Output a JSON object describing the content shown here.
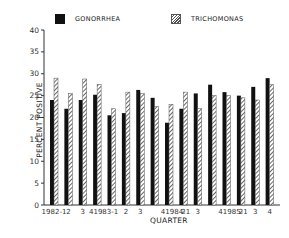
{
  "legend": {
    "gonorrhea": "GONORRHEA",
    "trichomonas": "TRICHOMONAS"
  },
  "axes": {
    "ylabel": "PERCENT POSITIVE",
    "xlabel": "QUARTER",
    "yticks": [
      "0",
      "5",
      "10",
      "15",
      "20",
      "25",
      "30",
      "35",
      "40"
    ],
    "xtick_labels": [
      "1982-1",
      "2",
      "3",
      "41983-1",
      "2",
      "3",
      "41984-1",
      "2",
      "3",
      "41985-1",
      "2",
      "3",
      "4"
    ]
  },
  "colors": {
    "gonorrhea": "#111111",
    "trichomonas": "#777777"
  },
  "chart_data": {
    "type": "bar",
    "title": "",
    "xlabel": "QUARTER",
    "ylabel": "PERCENT POSITIVE",
    "ylim": [
      0,
      40
    ],
    "grid": false,
    "legend_position": "top",
    "categories": [
      "1982-1",
      "1982-2",
      "1982-3",
      "1982-4",
      "1983-1",
      "1983-2",
      "1983-3",
      "1983-4",
      "1984-1",
      "1984-2",
      "1984-3",
      "1984-4",
      "1985-1",
      "1985-2",
      "1985-3",
      "1985-4"
    ],
    "series": [
      {
        "name": "GONORRHEA",
        "values": [
          24,
          22,
          24,
          25.2,
          20.5,
          21,
          26.3,
          24.5,
          18.8,
          22,
          25.5,
          27.5,
          25.8,
          25,
          27,
          29
        ]
      },
      {
        "name": "TRICHOMONAS",
        "values": [
          29,
          25.5,
          28.8,
          27.5,
          22,
          25.8,
          25.5,
          22.5,
          23,
          25.8,
          22,
          25,
          25,
          24.5,
          24,
          27.5
        ]
      }
    ]
  }
}
